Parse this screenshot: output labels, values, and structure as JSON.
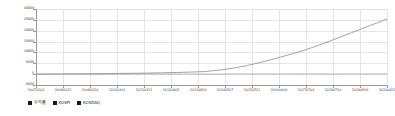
{
  "chart_data": {
    "type": "line",
    "title": "",
    "xlabel": "",
    "ylabel": "",
    "ylim": [
      -5000,
      30000
    ],
    "grid": true,
    "legend_position": "bottom-left",
    "y_ticks": [
      "30000",
      "25000",
      "20000",
      "15000",
      "10000",
      "5000",
      "0",
      "-5000"
    ],
    "y_tick_values": [
      30000,
      25000,
      20000,
      15000,
      10000,
      5000,
      0,
      -5000
    ],
    "x_tick_labels": [
      "20070202",
      "20080131",
      "20090220",
      "20100302",
      "20110321",
      "20120405",
      "20130419",
      "20140507",
      "20150522",
      "20160609",
      "20170706",
      "20180730",
      "20190819",
      "20200422"
    ],
    "categories": [
      "20070202",
      "20080131",
      "20090220",
      "20100302",
      "20110321",
      "20120405",
      "20130419",
      "20140507",
      "20150522",
      "20160609",
      "20170706",
      "20180730",
      "20190819",
      "20200422"
    ],
    "series": [
      {
        "name": "수익률",
        "color": "#8c8c8c",
        "values": [
          0,
          120,
          260,
          430,
          700,
          1000,
          1450,
          3200,
          6100,
          9400,
          13200,
          17600,
          21800,
          25400
        ],
        "points": [
          [
            0,
            0
          ],
          [
            0.04,
            40
          ],
          [
            0.08,
            90
          ],
          [
            0.12,
            140
          ],
          [
            0.16,
            190
          ],
          [
            0.2,
            250
          ],
          [
            0.24,
            320
          ],
          [
            0.28,
            400
          ],
          [
            0.32,
            500
          ],
          [
            0.36,
            620
          ],
          [
            0.4,
            760
          ],
          [
            0.44,
            950
          ],
          [
            0.48,
            1200
          ],
          [
            0.52,
            1800
          ],
          [
            0.56,
            2700
          ],
          [
            0.6,
            3900
          ],
          [
            0.64,
            5400
          ],
          [
            0.68,
            7100
          ],
          [
            0.72,
            8900
          ],
          [
            0.76,
            10800
          ],
          [
            0.8,
            13000
          ],
          [
            0.84,
            15400
          ],
          [
            0.88,
            17900
          ],
          [
            0.92,
            20400
          ],
          [
            0.95,
            22300
          ],
          [
            0.97,
            23500
          ],
          [
            1.0,
            25400
          ]
        ]
      },
      {
        "name": "KOSPI",
        "color": "#b5b5b5",
        "values": [
          0,
          10,
          -40,
          20,
          60,
          40,
          30,
          50,
          70,
          60,
          90,
          80,
          70,
          60
        ]
      },
      {
        "name": "KOSDAQ",
        "color": "#c9c9c9",
        "values": [
          0,
          -20,
          -60,
          -10,
          20,
          0,
          -10,
          10,
          30,
          20,
          40,
          30,
          20,
          10
        ]
      }
    ]
  },
  "legend": {
    "items": [
      {
        "label": "수익률",
        "color": "#1a1a1a"
      },
      {
        "label": "KOSPI",
        "color": "#1a1a1a"
      },
      {
        "label": "KOSDAQ",
        "color": "#1a1a1a"
      }
    ]
  },
  "colors": {
    "grid": "#e4e4e4",
    "axis": "#9a9a9a",
    "text": "#3a3a3a",
    "background": "#ffffff"
  }
}
